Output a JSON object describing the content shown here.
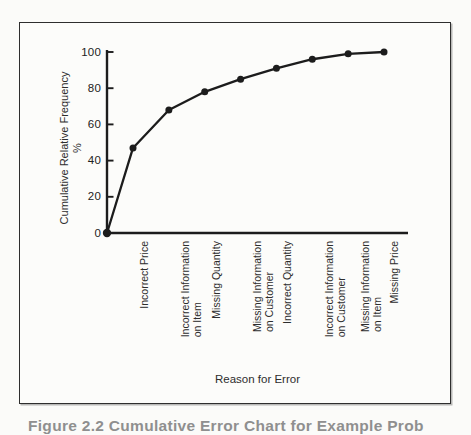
{
  "figure": {
    "caption_partial": "Figure 2.2  Cumulative Error Chart for Example Prob"
  },
  "chart_data": {
    "type": "line",
    "title": "",
    "xlabel": "Reason for Error",
    "ylabel": "Cumulative Relative Frequency",
    "ylabel_unit": "%",
    "ylim": [
      0,
      100
    ],
    "yticks": [
      0,
      20,
      40,
      60,
      80,
      100
    ],
    "grid": false,
    "legend": "none",
    "starts_at_origin": true,
    "marker": "filled-circle",
    "line_color": "#1c1c1c",
    "categories": [
      "Incorrect Price",
      "Incorrect Information\non Item",
      "Missing Quantity",
      "Missing Information\non Customer",
      "Incorrect Quantity",
      "Incorrect Information\non Customer",
      "Missing Information\non Item",
      "Missing Price"
    ],
    "values": [
      47,
      68,
      78,
      85,
      91,
      96,
      99,
      100
    ]
  }
}
